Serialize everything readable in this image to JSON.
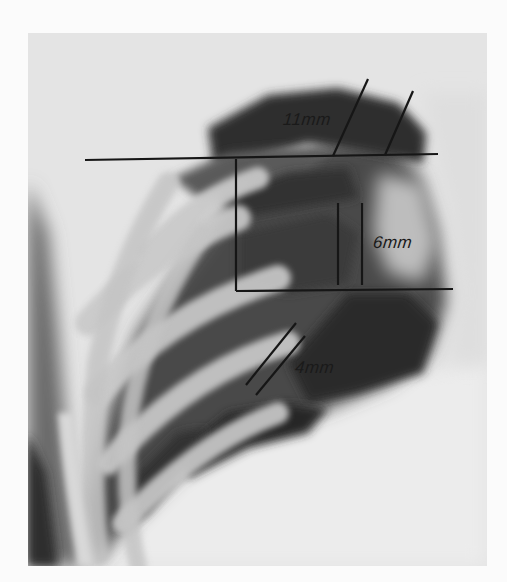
{
  "figure": {
    "type": "chest radiograph",
    "annotations": {
      "measurement_upper": "11mm",
      "measurement_middle": "6mm",
      "measurement_lower": "4mm"
    },
    "colors": {
      "background": "#fbfbfb",
      "film_light": "#e6e6e6",
      "lung_dark": "#3a3a3a",
      "rib_light": "#cfcfcf",
      "annotation_line": "#161616"
    }
  }
}
